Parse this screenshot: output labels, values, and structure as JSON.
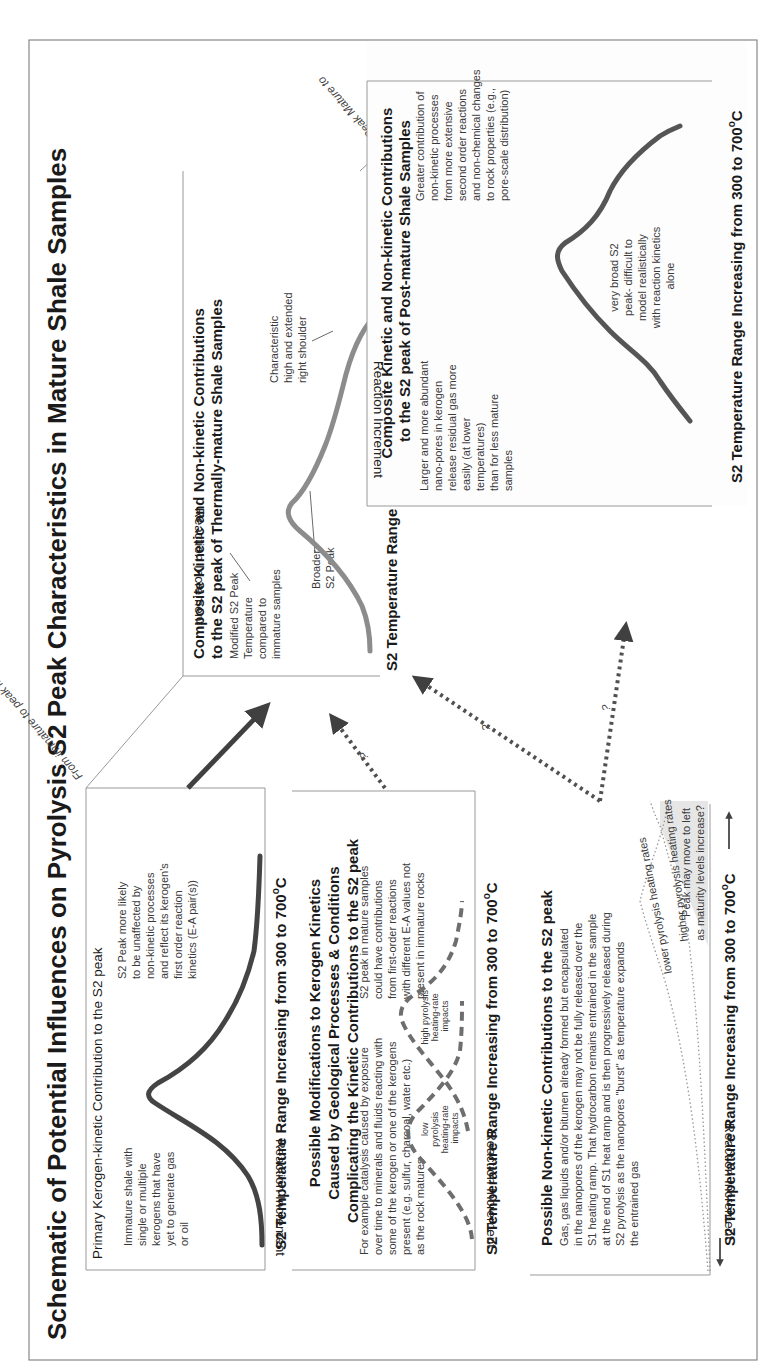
{
  "title": "Schematic of Potential Influences on Pyrolysis S2 Peak Characteristics in Mature Shale Samples",
  "colors": {
    "curve_dark": "#444444",
    "curve_gray": "#8c8c8c",
    "dashed_curve": "#6e6e6e",
    "arrow": "#404040",
    "shade": "#e6e6e6",
    "frame": "#888888"
  },
  "axis_common": {
    "x_label": "S2 Temperature Range Increasing from 300 to 700",
    "x_unit_sup": "o",
    "x_unit": "C",
    "y_label": "Reaction Increment"
  },
  "transitions": {
    "immature_to_peak": "From immature to peak mature",
    "peak_to_post_line1": "From Peak Mature to",
    "peak_to_post_line2": "Post Mature",
    "question_mark": "?"
  },
  "panels": {
    "primary": {
      "title": "Primary Kerogen-kinetic Contribution to the S2 peak",
      "left_note": [
        "Immature shale with",
        "single or multiple",
        "kerogens that have",
        "yet to generate gas",
        "or oil"
      ],
      "right_note": [
        "S2 Peak more likely",
        "to be unaffected by",
        "non-kinetic processes",
        "and reflect its kerogen's",
        "first order reaction",
        "kinetics (E-A pair(s))"
      ]
    },
    "modifications": {
      "title": [
        "Possible Modifications to Kerogen Kinetics",
        "Caused by Geological Processes & Conditions",
        "Complicating the Kinetic Contributions to the S2 peak"
      ],
      "left_note": [
        "For example catalysis caused by exposure",
        "over time to minerals and fluids reacting with",
        "some of the kerogen or one of the kerogens",
        "present (e.g. sulfur, charcoal, water etc.)",
        "as the rock matures"
      ],
      "right_note": [
        "S2 peak in mature samples",
        "could have contributions",
        "from first-order reactions",
        "with different E-A values not",
        "present in immature rocks"
      ],
      "low_label": [
        "low",
        "pyrolysis",
        "heating-rate",
        "impacts"
      ],
      "high_label": [
        "high pyrolysis",
        "heating-rate",
        "impacts"
      ]
    },
    "non_kinetic": {
      "title": "Possible Non-kinetic Contributions to the S2 peak",
      "note": [
        "Gas, gas liquids and/or bitumen already formed but encapsulated",
        "in the nanopores of the kerogen may not be fully released over the",
        "S1 heating ramp. That hydrocarbon remains entrained in the sample",
        "at the end of S1 heat ramp and is then progressively released during",
        "S2 pyrolysis as the nanopores \"burst\" as temperature expands",
        "the entrained gas"
      ],
      "lower_rates": "lower pyrolysis heating rates",
      "higher_rates": "higher pyrolysis heating rates",
      "shift_note": [
        "Peak may move to left",
        "as maturity levels increase?"
      ]
    },
    "thermally_mature": {
      "title": [
        "Composite Kinetic and Non-kinetic Contributions",
        "to the S2 peak of Thermally-mature Shale Samples"
      ],
      "modified_note": [
        "Modified S2 Peak",
        "Temperature",
        "compared to",
        "immature samples"
      ],
      "broader_note": [
        "Broader",
        "S2 Peak"
      ],
      "shoulder_note": [
        "Characteristic",
        "high and extended",
        "right shoulder"
      ]
    },
    "post_mature": {
      "title": [
        "Composite Kinetic and Non-kinetic Contributions",
        "to the S2 peak of Post-mature Shale Samples"
      ],
      "left_note": [
        "Larger and more abundant",
        "nano-pores in kerogen",
        "release residual gas more",
        "easily (at lower",
        "temperatures)",
        "than for less mature",
        "samples"
      ],
      "center_note": [
        "very broad S2",
        "peak- difficult to",
        "model realistically",
        "with reaction kinetics",
        "alone"
      ],
      "right_note": [
        "Greater contribution of",
        "non-kinetic processes",
        "from more extensive",
        "second order reactions",
        "and non-chemical changes",
        "to rock properties (e.g.,",
        "pore-scale distribution)"
      ]
    }
  }
}
